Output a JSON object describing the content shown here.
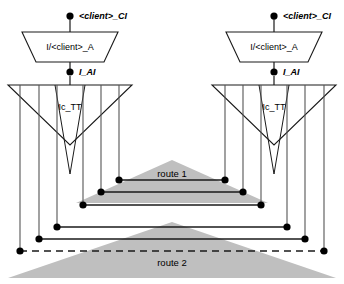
{
  "diagram": {
    "title": "",
    "colors": {
      "stroke": "#1a1a1a",
      "node_fill": "#000000",
      "shape_fill": "#ffffff",
      "route_fill": "#bfbfbf",
      "background": "#ffffff"
    },
    "stacks": [
      {
        "id": "left",
        "client_node_label": "<client>_CI",
        "adapter_label": "I/<client>_A",
        "interface_node_label": "I_AI",
        "bus_label": "Ic_TT"
      },
      {
        "id": "right",
        "client_node_label": "<client>_CI",
        "adapter_label": "I/<client>_A",
        "interface_node_label": "I_AI",
        "bus_label": "Ic_TT"
      }
    ],
    "routes": [
      {
        "id": "route-1",
        "label": "route 1",
        "style": "solid"
      },
      {
        "id": "route-2",
        "label": "route 2",
        "style": "dashed"
      }
    ]
  }
}
